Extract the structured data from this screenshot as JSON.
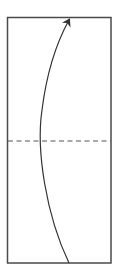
{
  "diagram": {
    "type": "fold-instruction",
    "paper": {
      "x": 7,
      "y": 17,
      "width": 104,
      "height": 246,
      "stroke": "#4a4a4a",
      "fill": "#ffffff"
    },
    "fold_line": {
      "style": "dashed",
      "y": 141,
      "stroke": "#555555"
    },
    "arrow": {
      "direction": "up",
      "stroke": "#333333"
    }
  }
}
